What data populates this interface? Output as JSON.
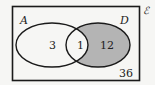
{
  "diagram": {
    "type": "venn",
    "universal_label": "ℰ",
    "sets": [
      {
        "name": "A",
        "label": "A"
      },
      {
        "name": "D",
        "label": "D"
      }
    ],
    "regions": {
      "A_only": "3",
      "A_and_D": "1",
      "D_only": "12",
      "neither": "36"
    },
    "shaded_region": "D_only",
    "colors": {
      "shade": "#b4b4b4",
      "stroke": "#1a1a1a",
      "background": "#f6f6f4"
    }
  }
}
